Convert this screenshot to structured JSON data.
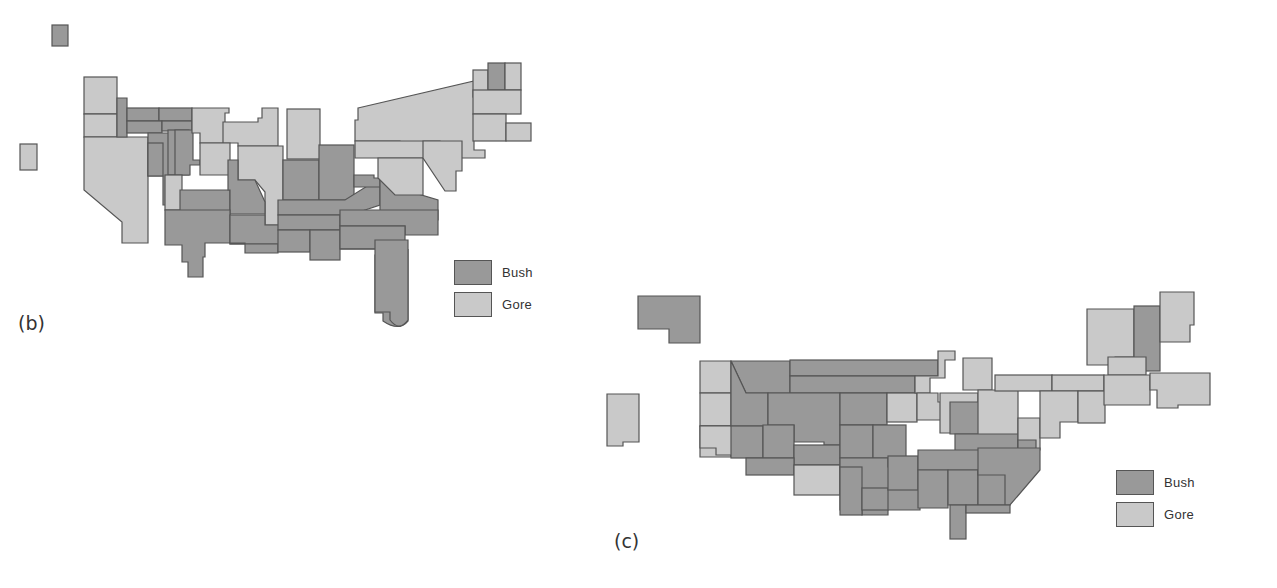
{
  "colors": {
    "bush": "#999999",
    "gore": "#c9c9c9",
    "border": "#555555"
  },
  "panels": [
    {
      "id": "b",
      "label": "(b)",
      "legend": [
        {
          "label": "Bush",
          "party": "bush"
        },
        {
          "label": "Gore",
          "party": "gore"
        }
      ]
    },
    {
      "id": "c",
      "label": "(c)",
      "legend": [
        {
          "label": "Bush",
          "party": "bush"
        },
        {
          "label": "Gore",
          "party": "gore"
        }
      ]
    }
  ]
}
